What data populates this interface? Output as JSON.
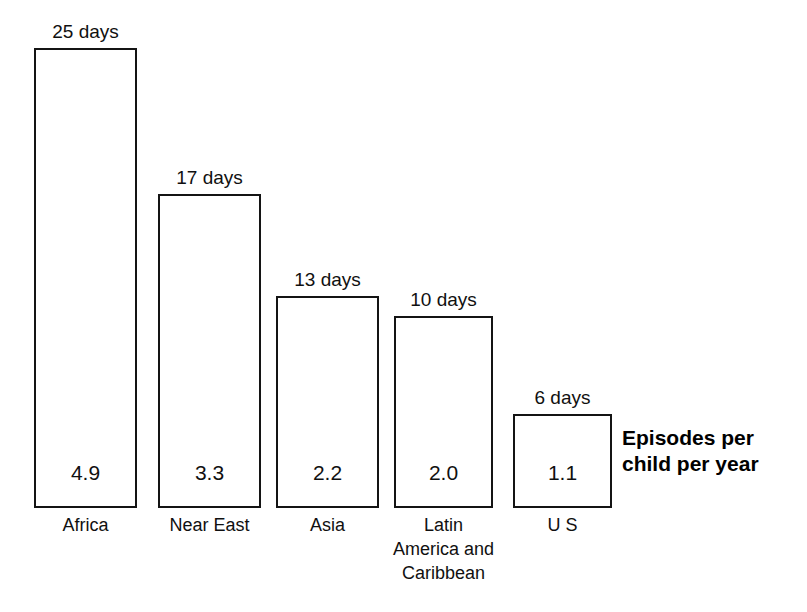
{
  "chart_data": {
    "type": "bar",
    "title": "",
    "subtitle": "",
    "xlabel": "",
    "ylabel": "Episodes per child per year",
    "annotation": "Episodes per child per year",
    "annotation_lines": [
      "Episodes per",
      "child per year"
    ],
    "grid": false,
    "legend": false,
    "legend_position": "none",
    "ylim": [
      0,
      5.4
    ],
    "categories": [
      "Africa",
      "Near East",
      "Asia",
      "Latin America and Caribbean",
      "U S"
    ],
    "category_lines": [
      [
        "Africa"
      ],
      [
        "Near East"
      ],
      [
        "Asia"
      ],
      [
        "Latin",
        "America and",
        "Caribbean"
      ],
      [
        "U S"
      ]
    ],
    "values": [
      4.9,
      3.3,
      2.2,
      2.0,
      1.1
    ],
    "value_labels": [
      "4.9",
      "3.3",
      "2.2",
      "2.0",
      "1.1"
    ],
    "top_labels": [
      "25 days",
      "17 days",
      "13 days",
      "10 days",
      "6 days"
    ],
    "days_values": [
      25,
      17,
      13,
      10,
      6
    ],
    "days_unit": "days",
    "series": [
      {
        "name": "Episodes per child per year",
        "values": [
          4.9,
          3.3,
          2.2,
          2.0,
          1.1
        ]
      },
      {
        "name": "Days of diarrhoea per year",
        "values": [
          25,
          17,
          13,
          10,
          6
        ]
      }
    ]
  },
  "style": {
    "bar_stroke": "#141414",
    "bar_fill": "#ffffff",
    "text_color": "#101010",
    "background": "#ffffff"
  },
  "geometry": {
    "baseline_y": 508,
    "bars": [
      {
        "x": 34,
        "width": 103,
        "top": 48,
        "height": 460
      },
      {
        "x": 158,
        "width": 103,
        "top": 194,
        "height": 314
      },
      {
        "x": 276,
        "width": 103,
        "top": 296,
        "height": 212
      },
      {
        "x": 394,
        "width": 99,
        "top": 316,
        "height": 192
      },
      {
        "x": 513,
        "width": 99,
        "top": 414,
        "height": 94
      }
    ],
    "annotation": {
      "x": 622,
      "y": 425
    }
  }
}
